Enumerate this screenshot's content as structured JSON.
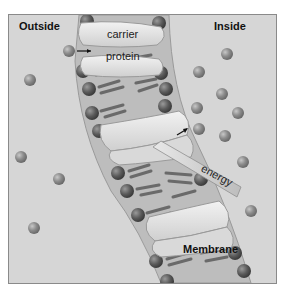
{
  "figure": {
    "labels": {
      "outside": "Outside",
      "inside": "Inside",
      "carrier": "carrier",
      "protein": "protein",
      "energy": "energy",
      "membrane": "Membrane"
    },
    "colors": {
      "background": "#d6d6d6",
      "membrane": "#b9b9b9",
      "phospholipid_head": "#5e5e5e",
      "tail": "#6e6e6e",
      "protein": "#e6e6e6",
      "solute": "#8f8f8f"
    },
    "solutes_outside": [
      [
        68,
        50
      ],
      [
        29,
        79
      ],
      [
        20,
        156
      ],
      [
        58,
        178
      ],
      [
        33,
        227
      ]
    ],
    "solutes_inside": [
      [
        226,
        53
      ],
      [
        198,
        71
      ],
      [
        221,
        93
      ],
      [
        196,
        107
      ],
      [
        237,
        112
      ],
      [
        198,
        128
      ],
      [
        224,
        135
      ],
      [
        242,
        161
      ],
      [
        250,
        210
      ]
    ]
  }
}
